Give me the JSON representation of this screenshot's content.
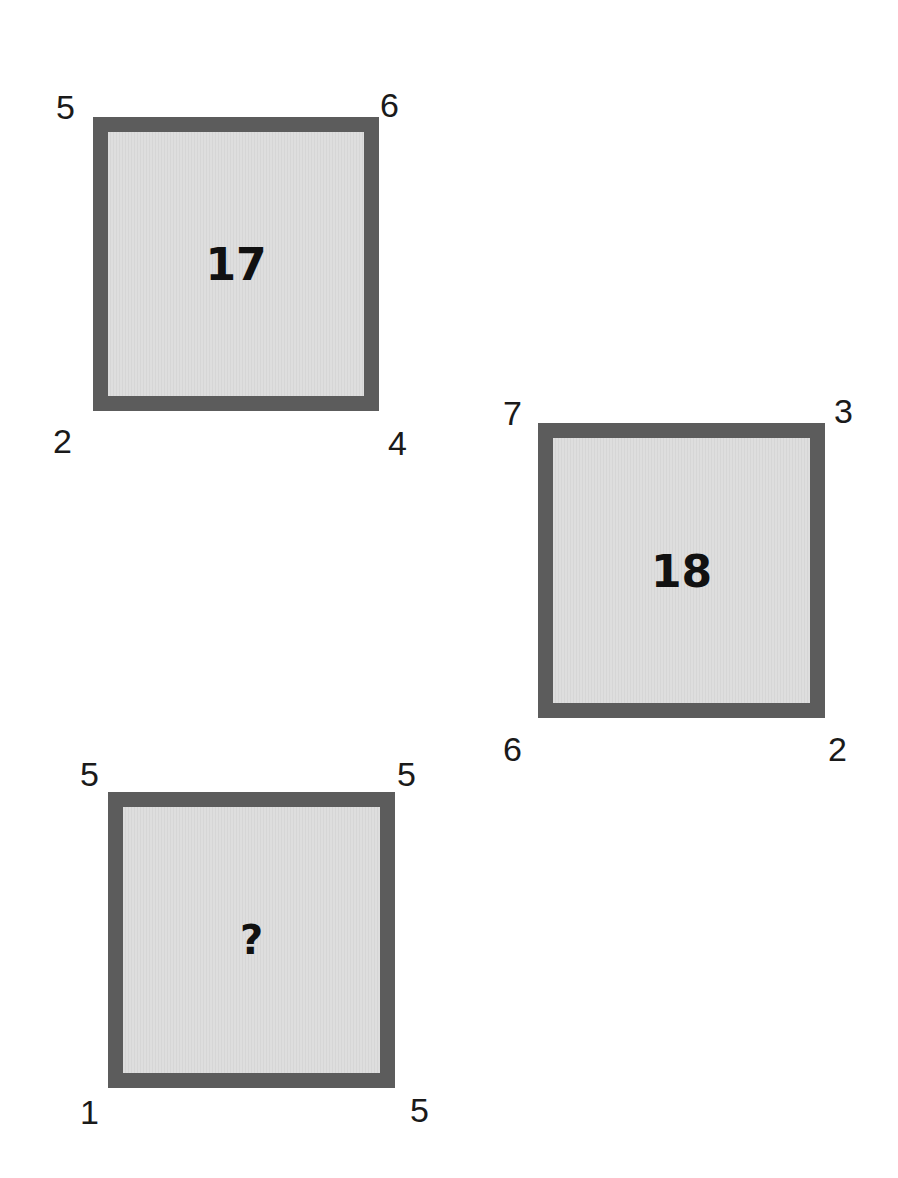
{
  "puzzle": {
    "squares": [
      {
        "center": "17",
        "corners": {
          "top_left": "5",
          "top_right": "6",
          "bottom_left": "2",
          "bottom_right": "4"
        }
      },
      {
        "center": "18",
        "corners": {
          "top_left": "7",
          "top_right": "3",
          "bottom_left": "6",
          "bottom_right": "2"
        }
      },
      {
        "center": "?",
        "corners": {
          "top_left": "5",
          "top_right": "5",
          "bottom_left": "1",
          "bottom_right": "5"
        }
      }
    ],
    "colors": {
      "border": "#5c5c5c",
      "fill": "#dadada",
      "text": "#111111"
    }
  }
}
